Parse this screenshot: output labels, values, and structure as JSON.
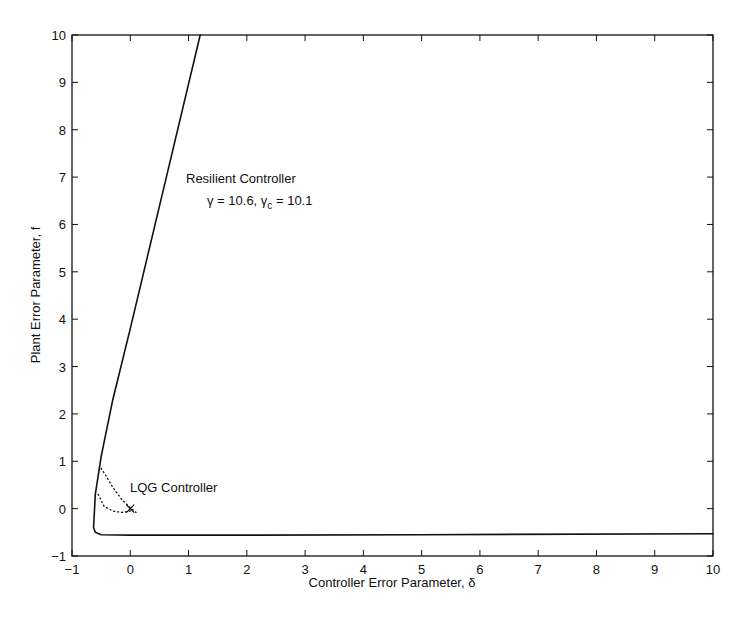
{
  "chart_data": {
    "type": "line",
    "title": "",
    "xlabel": "Controller Error Parameter, δ",
    "ylabel": "Plant Error Parameter, f",
    "xlim": [
      -1,
      10
    ],
    "ylim": [
      -1,
      10
    ],
    "xticks": [
      -1,
      0,
      1,
      2,
      3,
      4,
      5,
      6,
      7,
      8,
      9,
      10
    ],
    "yticks": [
      -1,
      0,
      1,
      2,
      3,
      4,
      5,
      6,
      7,
      8,
      9,
      10
    ],
    "grid": false,
    "series": [
      {
        "name": "Resilient Controller",
        "style": "solid",
        "x": [
          1.2,
          0.6,
          0.0,
          -0.3,
          -0.5,
          -0.6,
          -0.63,
          -0.6,
          -0.5,
          0,
          2,
          5,
          10
        ],
        "y": [
          10,
          6.9,
          3.8,
          2.3,
          1.1,
          0.3,
          -0.4,
          -0.5,
          -0.55,
          -0.56,
          -0.56,
          -0.55,
          -0.53
        ]
      },
      {
        "name": "LQG Controller region (upper dotted)",
        "style": "dotted",
        "x": [
          -0.5,
          -0.42,
          -0.3,
          -0.15,
          0.0,
          0.1
        ],
        "y": [
          0.85,
          0.7,
          0.45,
          0.2,
          0.02,
          -0.08
        ]
      },
      {
        "name": "LQG Controller region (lower dotted)",
        "style": "dotted",
        "x": [
          -0.55,
          -0.45,
          -0.3,
          -0.15,
          0.0
        ],
        "y": [
          0.3,
          0.05,
          -0.05,
          -0.08,
          -0.05
        ]
      },
      {
        "name": "LQG nominal point",
        "style": "marker-x",
        "x": [
          0
        ],
        "y": [
          0
        ]
      }
    ],
    "annotations": [
      {
        "text": "Resilient Controller",
        "x": 1.0,
        "y": 7.1
      },
      {
        "text_main": "γ = 10.6, γ",
        "sub": "c",
        "text_tail": " = 10.1",
        "x": 1.3,
        "y": 6.5
      },
      {
        "text": "LQG Controller",
        "x": 0.0,
        "y": 0.4
      }
    ]
  },
  "labels": {
    "xlabel": "Controller Error Parameter, δ",
    "ylabel": "Plant Error Parameter, f",
    "resilient": "Resilient Controller",
    "gamma_main": "γ = 10.6, γ",
    "gamma_sub": "c",
    "gamma_tail": " = 10.1",
    "lqg": "LQG Controller"
  }
}
